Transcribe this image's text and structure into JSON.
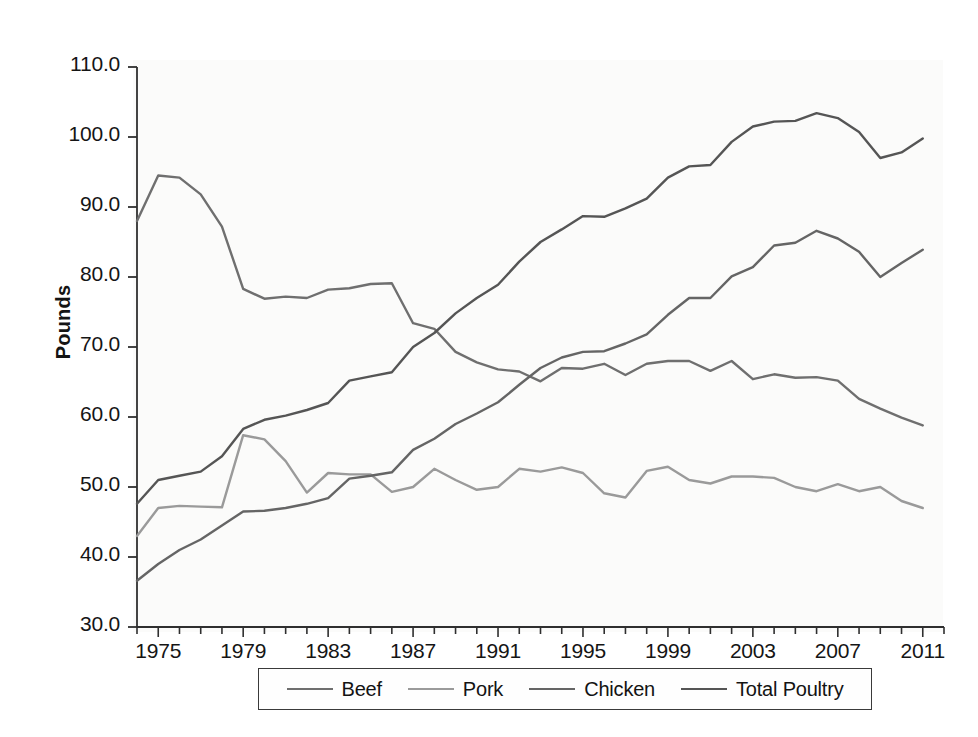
{
  "figure": {
    "background_color": "#ffffff",
    "plot_background_color": "#fbfbfa",
    "axis_color": "#2f2f2f"
  },
  "axes": {
    "y_axis_title": "Pounds",
    "y_ticks": [
      "110.0",
      "100.0",
      "90.0",
      "80.0",
      "70.0",
      "60.0",
      "50.0",
      "40.0",
      "30.0"
    ],
    "x_ticks": [
      "1975",
      "1979",
      "1983",
      "1987",
      "1991",
      "1995",
      "1999",
      "2003",
      "2007",
      "2011"
    ]
  },
  "legend": {
    "items": [
      {
        "label": "Beef",
        "color": "#6f6f6f"
      },
      {
        "label": "Pork",
        "color": "#9a9a9a"
      },
      {
        "label": "Chicken",
        "color": "#656565"
      },
      {
        "label": "Total Poultry",
        "color": "#555555"
      }
    ]
  },
  "chart_data": {
    "type": "line",
    "title": "",
    "xlabel": "",
    "ylabel": "Pounds",
    "xlim": [
      1974,
      2012
    ],
    "ylim": [
      30.0,
      110.0
    ],
    "ytick_values": [
      110.0,
      100.0,
      90.0,
      80.0,
      70.0,
      60.0,
      50.0,
      40.0,
      30.0
    ],
    "xtick_values": [
      1975,
      1979,
      1983,
      1987,
      1991,
      1995,
      1999,
      2003,
      2007,
      2011
    ],
    "minor_xticks": "every year 1974-2012",
    "grid": false,
    "legend_position": "bottom-outside",
    "x": [
      1974,
      1975,
      1976,
      1977,
      1978,
      1979,
      1980,
      1981,
      1982,
      1983,
      1984,
      1985,
      1986,
      1987,
      1988,
      1989,
      1990,
      1991,
      1992,
      1993,
      1994,
      1995,
      1996,
      1997,
      1998,
      1999,
      2000,
      2001,
      2002,
      2003,
      2004,
      2005,
      2006,
      2007,
      2008,
      2009,
      2010,
      2011
    ],
    "series": [
      {
        "name": "Beef",
        "color": "#6f6f6f",
        "values": [
          88.0,
          94.5,
          94.2,
          91.8,
          87.2,
          78.3,
          76.9,
          77.2,
          77.0,
          78.2,
          78.4,
          79.0,
          79.1,
          73.4,
          72.6,
          69.3,
          67.8,
          66.8,
          66.5,
          65.1,
          67.0,
          66.9,
          67.6,
          66.0,
          67.6,
          68.0,
          68.0,
          66.6,
          68.0,
          65.4,
          66.1,
          65.6,
          65.7,
          65.2,
          62.6,
          61.2,
          59.9,
          58.8
        ]
      },
      {
        "name": "Pork",
        "color": "#9a9a9a",
        "values": [
          43.0,
          47.0,
          47.3,
          47.2,
          47.1,
          57.4,
          56.8,
          53.7,
          49.2,
          52.0,
          51.8,
          51.8,
          49.3,
          50.0,
          52.6,
          51.0,
          49.6,
          50.0,
          52.6,
          52.2,
          52.8,
          52.0,
          49.1,
          48.5,
          52.3,
          52.9,
          51.0,
          50.5,
          51.5,
          51.5,
          51.3,
          50.0,
          49.4,
          50.4,
          49.4,
          50.0,
          48.0,
          47.0
        ]
      },
      {
        "name": "Chicken",
        "color": "#656565",
        "values": [
          36.6,
          39.0,
          41.0,
          42.5,
          44.5,
          46.5,
          46.6,
          47.0,
          47.6,
          48.4,
          51.2,
          51.6,
          52.1,
          55.3,
          56.9,
          59.0,
          60.5,
          62.1,
          64.6,
          67.0,
          68.5,
          69.3,
          69.4,
          70.5,
          71.8,
          74.6,
          77.0,
          77.0,
          80.1,
          81.4,
          84.5,
          84.9,
          86.6,
          85.5,
          83.6,
          80.0,
          82.0,
          83.9
        ]
      },
      {
        "name": "Total Poultry",
        "color": "#555555",
        "values": [
          47.6,
          51.0,
          51.6,
          52.2,
          54.4,
          58.3,
          59.6,
          60.2,
          61.0,
          62.0,
          65.2,
          65.8,
          66.4,
          70.0,
          72.0,
          74.8,
          77.0,
          78.9,
          82.2,
          85.0,
          86.8,
          88.7,
          88.6,
          89.8,
          91.2,
          94.2,
          95.8,
          96.0,
          99.3,
          101.5,
          102.2,
          102.3,
          103.4,
          102.7,
          100.7,
          97.0,
          97.8,
          99.8
        ]
      }
    ]
  }
}
